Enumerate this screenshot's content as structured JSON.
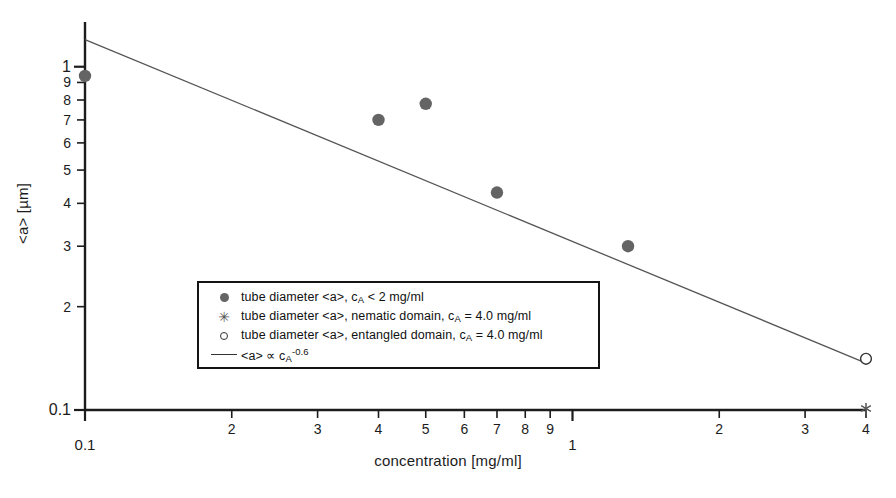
{
  "figure": {
    "background_color": "#ffffff",
    "foreground_color": "#1a1a1a"
  },
  "axes": {
    "x": {
      "label": "concentration [mg/ml]",
      "scale": "log",
      "min": 0.1,
      "max": 4.0,
      "ticks": [
        {
          "value": 0.1,
          "label": "0.1",
          "decade": true
        },
        {
          "value": 0.2,
          "label": "2",
          "decade": false
        },
        {
          "value": 0.3,
          "label": "3",
          "decade": false
        },
        {
          "value": 0.4,
          "label": "4",
          "decade": false
        },
        {
          "value": 0.5,
          "label": "5",
          "decade": false
        },
        {
          "value": 0.6,
          "label": "6",
          "decade": false
        },
        {
          "value": 0.7,
          "label": "7",
          "decade": false
        },
        {
          "value": 0.8,
          "label": "8",
          "decade": false
        },
        {
          "value": 0.9,
          "label": "9",
          "decade": false
        },
        {
          "value": 1.0,
          "label": "1",
          "decade": true
        },
        {
          "value": 2.0,
          "label": "2",
          "decade": false
        },
        {
          "value": 3.0,
          "label": "3",
          "decade": false
        },
        {
          "value": 4.0,
          "label": "4",
          "decade": false
        }
      ]
    },
    "y": {
      "label": "<a> [µm]",
      "scale": "log",
      "min": 0.1,
      "max": 1.35,
      "ticks": [
        {
          "value": 0.1,
          "label": "0.1",
          "decade": true
        },
        {
          "value": 0.2,
          "label": "2",
          "decade": false
        },
        {
          "value": 0.3,
          "label": "3",
          "decade": false
        },
        {
          "value": 0.4,
          "label": "4",
          "decade": false
        },
        {
          "value": 0.5,
          "label": "5",
          "decade": false
        },
        {
          "value": 0.6,
          "label": "6",
          "decade": false
        },
        {
          "value": 0.7,
          "label": "7",
          "decade": false
        },
        {
          "value": 0.8,
          "label": "8",
          "decade": false
        },
        {
          "value": 0.9,
          "label": "9",
          "decade": false
        },
        {
          "value": 1.0,
          "label": "1",
          "decade": true
        }
      ]
    }
  },
  "legend": {
    "position": "inside-lower-left",
    "entries": [
      {
        "marker": "filled-circle",
        "color": "#646464",
        "text_parts": [
          "tube diameter <a>, c",
          "A",
          " < 2 mg/ml"
        ],
        "text": "tube diameter <a>, cA < 2 mg/ml"
      },
      {
        "marker": "asterisk",
        "color": "#555555",
        "text_parts": [
          "tube diameter <a>, nematic domain, c",
          "A",
          " = 4.0 mg/ml"
        ],
        "text": "tube diameter <a>, nematic domain, cA = 4.0 mg/ml"
      },
      {
        "marker": "open-circle",
        "color": "#333333",
        "text_parts": [
          "tube diameter <a>, entangled domain, c",
          "A",
          " = 4.0 mg/ml"
        ],
        "text": "tube diameter <a>, entangled domain, cA = 4.0 mg/ml"
      },
      {
        "marker": "line",
        "color": "#333333",
        "text_parts": [
          "<a> ∝ c",
          "A",
          "",
          "-0.6"
        ],
        "text": "<a> ∝ cA^-0.6"
      }
    ]
  },
  "chart_data": {
    "type": "scatter",
    "title": "",
    "xlabel": "concentration [mg/ml]",
    "ylabel": "<a> [µm]",
    "xscale": "log",
    "yscale": "log",
    "xlim": [
      0.1,
      4.0
    ],
    "ylim": [
      0.1,
      1.35
    ],
    "grid": false,
    "legend_position": "lower-left-inside",
    "series": [
      {
        "name": "tube diameter <a>, cA < 2 mg/ml",
        "marker": "filled-circle",
        "color": "#646464",
        "points": [
          {
            "x": 0.1,
            "y": 0.94
          },
          {
            "x": 0.4,
            "y": 0.7
          },
          {
            "x": 0.5,
            "y": 0.78
          },
          {
            "x": 0.7,
            "y": 0.43
          },
          {
            "x": 1.3,
            "y": 0.3
          }
        ]
      },
      {
        "name": "tube diameter <a>, nematic domain, cA = 4.0 mg/ml",
        "marker": "asterisk",
        "color": "#555555",
        "points": [
          {
            "x": 4.0,
            "y": 0.101
          }
        ]
      },
      {
        "name": "tube diameter <a>, entangled domain, cA = 4.0 mg/ml",
        "marker": "open-circle",
        "color": "#333333",
        "points": [
          {
            "x": 4.0,
            "y": 0.141
          }
        ]
      },
      {
        "name": "<a> ∝ cA^-0.6",
        "marker": "none",
        "type": "line",
        "color": "#555555",
        "fit": {
          "form": "power-law",
          "exponent": -0.6,
          "prefactor": 0.3
        },
        "points": [
          {
            "x": 0.1,
            "y": 1.2
          },
          {
            "x": 4.0,
            "y": 0.137
          }
        ]
      }
    ]
  }
}
